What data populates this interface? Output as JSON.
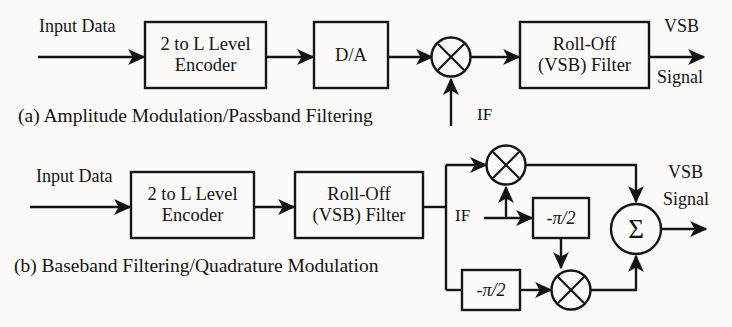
{
  "figure": {
    "background_color": "#fbfaf8",
    "line_color": "#141414"
  },
  "diagram_a": {
    "caption": "(a) Amplitude Modulation/Passband Filtering",
    "input_label": "Input Data",
    "encoder_line1": "2 to L Level",
    "encoder_line2": "Encoder",
    "da_label": "D/A",
    "multiplier_symbol": "×",
    "carrier_label": "IF",
    "filter_line1": "Roll-Off",
    "filter_line2": "(VSB) Filter",
    "output_line1": "VSB",
    "output_line2": "Signal"
  },
  "diagram_b": {
    "caption": "(b) Baseband Filtering/Quadrature Modulation",
    "input_label": "Input Data",
    "encoder_line1": "2 to L Level",
    "encoder_line2": "Encoder",
    "filter_line1": "Roll-Off",
    "filter_line2": "(VSB) Filter",
    "multiplier_top_symbol": "×",
    "multiplier_bottom_symbol": "×",
    "carrier_label": "IF",
    "phase_shift_upper": "-π/2",
    "phase_shift_lower": "-π/2",
    "summer_symbol": "Σ",
    "output_line1": "VSB",
    "output_line2": "Signal"
  }
}
